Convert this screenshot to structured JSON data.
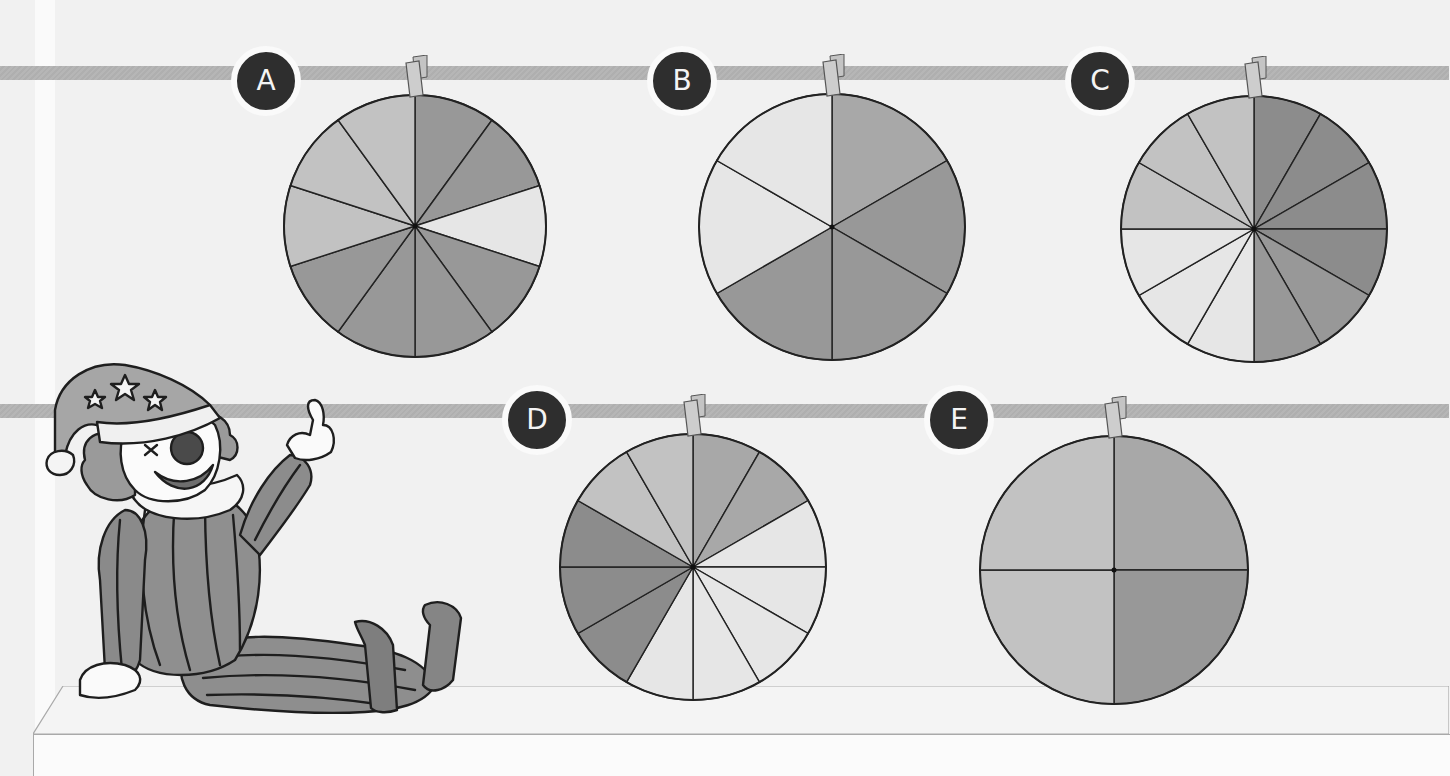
{
  "scene": {
    "description": "Five spinners hanging on two rails, with a clown sitting on a shelf",
    "colors": {
      "background": "#f1f1f1",
      "rail": "#b3b3b3",
      "badge": "#2e2e2e",
      "badge_text": "#f4f4f4",
      "outline": "#222222",
      "darkest": "#8c8c8c",
      "dark": "#989898",
      "medium": "#a8a8a8",
      "light": "#c2c2c2",
      "lightest": "#e6e6e6"
    }
  },
  "spinners": [
    {
      "label": "A",
      "cx": 415,
      "cy": 226,
      "r": 131,
      "sectors": [
        "dark",
        "dark",
        "lightest",
        "dark",
        "dark",
        "dark",
        "dark",
        "light",
        "light",
        "light"
      ]
    },
    {
      "label": "B",
      "cx": 832,
      "cy": 227,
      "r": 133,
      "sectors": [
        "medium",
        "dark",
        "dark",
        "dark",
        "lightest",
        "lightest"
      ]
    },
    {
      "label": "C",
      "cx": 1254,
      "cy": 229,
      "r": 133,
      "sectors": [
        "darkest",
        "darkest",
        "darkest",
        "darkest",
        "dark",
        "dark",
        "lightest",
        "lightest",
        "lightest",
        "light",
        "light",
        "light"
      ]
    },
    {
      "label": "D",
      "cx": 693,
      "cy": 567,
      "r": 133,
      "sectors": [
        "medium",
        "medium",
        "lightest",
        "lightest",
        "lightest",
        "lightest",
        "lightest",
        "darkest",
        "darkest",
        "darkest",
        "light",
        "light"
      ]
    },
    {
      "label": "E",
      "cx": 1114,
      "cy": 570,
      "r": 134,
      "sectors": [
        "medium",
        "dark",
        "light",
        "light"
      ]
    }
  ],
  "badges": [
    {
      "label": "A",
      "x": 231,
      "y": 46
    },
    {
      "label": "B",
      "x": 647,
      "y": 46
    },
    {
      "label": "C",
      "x": 1065,
      "y": 46
    },
    {
      "label": "D",
      "x": 502,
      "y": 385
    },
    {
      "label": "E",
      "x": 924,
      "y": 385
    }
  ],
  "rails": [
    {
      "y": 66
    },
    {
      "y": 404
    }
  ]
}
